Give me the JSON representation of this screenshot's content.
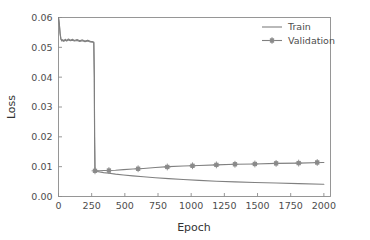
{
  "chart_data": {
    "type": "line",
    "title": "",
    "xlabel": "Epoch",
    "ylabel": "Loss",
    "xlim": [
      0,
      2050
    ],
    "ylim": [
      0.0,
      0.06
    ],
    "xticks": [
      0,
      250,
      500,
      750,
      1000,
      1250,
      1500,
      1750,
      2000
    ],
    "xticklabels": [
      "0",
      "250",
      "500",
      "750",
      "1000",
      "1250",
      "1500",
      "1750",
      "2000"
    ],
    "yticks": [
      0.0,
      0.01,
      0.02,
      0.03,
      0.04,
      0.05,
      0.06
    ],
    "yticklabels": [
      "0.00",
      "0.01",
      "0.02",
      "0.03",
      "0.04",
      "0.05",
      "0.06"
    ],
    "grid": false,
    "legend_position": "upper right",
    "line_color": "#808080",
    "marker_color": "#8a8a8a",
    "series": [
      {
        "name": "Train",
        "marker": "none",
        "x": [
          0,
          6,
          12,
          18,
          25,
          32,
          40,
          50,
          62,
          75,
          90,
          105,
          120,
          140,
          160,
          180,
          200,
          220,
          240,
          258,
          266,
          270,
          272,
          275,
          290,
          310,
          340,
          380,
          430,
          490,
          560,
          640,
          730,
          830,
          940,
          1060,
          1190,
          1330,
          1480,
          1640,
          1810,
          1990,
          2000
        ],
        "y": [
          0.06,
          0.0578,
          0.0545,
          0.0527,
          0.0521,
          0.0523,
          0.052,
          0.0524,
          0.0521,
          0.0525,
          0.0522,
          0.0524,
          0.0521,
          0.0523,
          0.052,
          0.0522,
          0.0519,
          0.0521,
          0.0518,
          0.0517,
          0.0516,
          0.04,
          0.02,
          0.0086,
          0.0084,
          0.0082,
          0.008,
          0.0078,
          0.0075,
          0.0072,
          0.0069,
          0.0066,
          0.0063,
          0.006,
          0.0057,
          0.0054,
          0.0051,
          0.0049,
          0.0047,
          0.0045,
          0.0043,
          0.0041,
          0.0041
        ]
      },
      {
        "name": "Validation",
        "marker": "square-plus",
        "x": [
          0,
          6,
          12,
          18,
          25,
          32,
          40,
          50,
          62,
          75,
          90,
          105,
          120,
          140,
          160,
          180,
          200,
          220,
          240,
          258,
          266,
          270,
          272,
          275,
          290,
          310,
          340,
          380,
          430,
          490,
          560,
          640,
          730,
          830,
          940,
          1060,
          1190,
          1330,
          1480,
          1640,
          1810,
          1990,
          2000
        ],
        "y": [
          0.06,
          0.058,
          0.0548,
          0.0529,
          0.0523,
          0.0526,
          0.0522,
          0.0527,
          0.0523,
          0.0528,
          0.0524,
          0.0527,
          0.0523,
          0.0526,
          0.0522,
          0.0525,
          0.0521,
          0.0524,
          0.052,
          0.0519,
          0.0518,
          0.04,
          0.02,
          0.0086,
          0.0086,
          0.0086,
          0.0087,
          0.0087,
          0.0088,
          0.009,
          0.0092,
          0.0094,
          0.0097,
          0.01,
          0.0102,
          0.0104,
          0.0106,
          0.0108,
          0.0109,
          0.0111,
          0.0112,
          0.0114,
          0.0114
        ],
        "marker_x": [
          275,
          380,
          600,
          820,
          1010,
          1190,
          1330,
          1480,
          1640,
          1810,
          1950
        ],
        "marker_y": [
          0.0086,
          0.0087,
          0.0093,
          0.0099,
          0.0103,
          0.0106,
          0.0108,
          0.0109,
          0.0111,
          0.0112,
          0.0114
        ]
      }
    ]
  },
  "legend": {
    "entries": [
      {
        "label": "Train"
      },
      {
        "label": "Validation"
      }
    ]
  }
}
